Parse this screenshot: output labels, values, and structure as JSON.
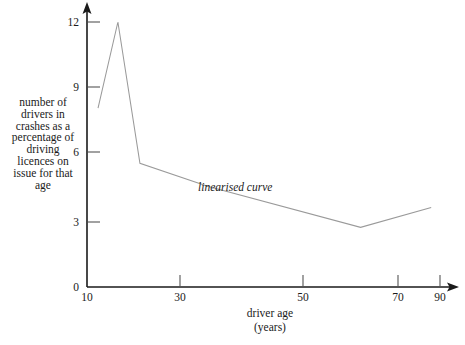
{
  "chart_data": {
    "type": "line",
    "title": "",
    "xlabel": "driver age\n(years)",
    "ylabel": "number of\ndrivers in\ncrashes as a\npercentage of\ndriving\nlicences on\nissue for that\nage",
    "xlim": [
      10,
      90
    ],
    "ylim": [
      0,
      12.9
    ],
    "grid": false,
    "legend": "none",
    "xticks": [
      10,
      30,
      50,
      70,
      90
    ],
    "xtick_labels": [
      "10",
      "30",
      "50",
      "70",
      "90"
    ],
    "yticks": [
      0,
      3,
      6,
      9,
      12
    ],
    "ytick_labels": [
      "0",
      "3",
      "6",
      "9",
      "12"
    ],
    "series": [
      {
        "name": "linearised curve",
        "x": [
          12.5,
          17.0,
          22.0,
          37.5,
          72.0,
          88.0
        ],
        "values": [
          8.1,
          12.0,
          5.6,
          4.55,
          2.7,
          3.6
        ],
        "color": "#9a9a9a"
      }
    ],
    "annotations": [
      {
        "text": "linearised curve",
        "x": 33.5,
        "y": 4.9,
        "style": "italic"
      }
    ],
    "axis_style": {
      "arrow_heads": true,
      "tick_direction": "inward",
      "axis_color": "#1a1a1a",
      "tick_color": "#555555"
    }
  },
  "xtick_labels": {
    "t0": "10",
    "t1": "30",
    "t2": "50",
    "t3": "70",
    "t4": "90"
  },
  "ytick_labels": {
    "t0": "0",
    "t1": "3",
    "t2": "6",
    "t3": "9",
    "t4": "12"
  },
  "labels": {
    "y_axis": "number of\ndrivers in\ncrashes as a\npercentage of\ndriving\nlicences on\nissue for that\nage",
    "x_axis": "driver age\n(years)",
    "curve_annotation": "linearised curve"
  }
}
